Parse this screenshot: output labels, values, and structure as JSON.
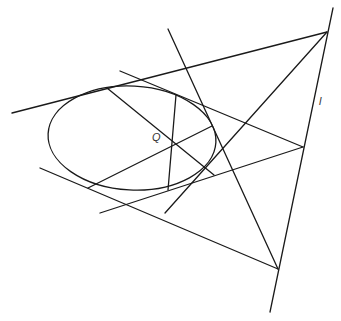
{
  "diagram": {
    "title": "",
    "stroke_color": "#1a1a1a",
    "background": "#ffffff",
    "ellipse": {
      "cx": 132,
      "cy": 138,
      "rx": 84,
      "ry": 52,
      "rotate": 3
    },
    "lines": [
      {
        "id": "top-tangent",
        "x1": 12,
        "y1": 113,
        "x2": 327,
        "y2": 32
      },
      {
        "id": "steep-line",
        "x1": 168,
        "y1": 29,
        "x2": 278,
        "y2": 269
      },
      {
        "id": "upper-secant",
        "x1": 120,
        "y1": 71,
        "x2": 303,
        "y2": 147
      },
      {
        "id": "bottom-tangent",
        "x1": 40,
        "y1": 168,
        "x2": 278,
        "y2": 269
      },
      {
        "id": "lower-secant",
        "x1": 100,
        "y1": 213,
        "x2": 303,
        "y2": 147
      },
      {
        "id": "diagonal-to-top",
        "x1": 165,
        "y1": 213,
        "x2": 327,
        "y2": 32
      },
      {
        "id": "polar-line-l",
        "x1": 333,
        "y1": 8,
        "x2": 270,
        "y2": 312
      },
      {
        "id": "chord-1",
        "x1": 107,
        "y1": 88,
        "x2": 214,
        "y2": 175
      },
      {
        "id": "chord-2",
        "x1": 176,
        "y1": 95,
        "x2": 168,
        "y2": 190
      },
      {
        "id": "chord-3",
        "x1": 88,
        "y1": 188,
        "x2": 212,
        "y2": 126
      }
    ],
    "labels": [
      {
        "id": "label-q",
        "text": "Q",
        "x": 152,
        "y": 137
      },
      {
        "id": "label-l",
        "text": "l",
        "x": 319,
        "y": 101
      }
    ]
  }
}
